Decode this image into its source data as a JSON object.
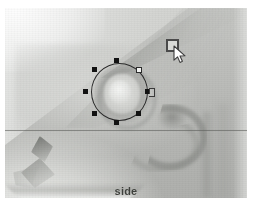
{
  "window": {
    "title": "side",
    "background_color": "#ffffff"
  },
  "photo": {
    "subject": "fish-head-side-view",
    "description": "Grayscale photograph of a fish head viewed from the side",
    "base_color": "#b9bab7",
    "highlight_color": "#e8e9e7",
    "shadow_color": "#6e706c",
    "guide_line_color": "#5c5e5a"
  },
  "selection": {
    "shape": "circle",
    "label": "eye-selection",
    "stroke_color": "#2b2b2b",
    "handle_color": "#121212",
    "active_handle_color": "#f2f3f1",
    "center_x": 114,
    "center_y": 84,
    "radius": 28,
    "handles": [
      {
        "name": "handle-top",
        "x": 111,
        "y": 52,
        "state": "filled"
      },
      {
        "name": "handle-top-right",
        "x": 134,
        "y": 62,
        "state": "hollow"
      },
      {
        "name": "handle-right",
        "x": 143,
        "y": 81,
        "state": "filled"
      },
      {
        "name": "handle-bottom-right",
        "x": 133,
        "y": 103,
        "state": "filled"
      },
      {
        "name": "handle-bottom",
        "x": 111,
        "y": 113,
        "state": "filled"
      },
      {
        "name": "handle-bottom-left",
        "x": 89,
        "y": 103,
        "state": "filled"
      },
      {
        "name": "handle-left",
        "x": 80,
        "y": 81,
        "state": "filled"
      },
      {
        "name": "handle-top-left",
        "x": 89,
        "y": 62,
        "state": "filled"
      }
    ]
  },
  "cursor": {
    "name": "rectangle-select-cursor",
    "x": 161,
    "y": 31,
    "box_color": "#d9dad7",
    "box_border_color": "#4a4a4a",
    "arrow_color": "#ffffff"
  },
  "caption": {
    "text": "side",
    "color": "#3e403c"
  }
}
